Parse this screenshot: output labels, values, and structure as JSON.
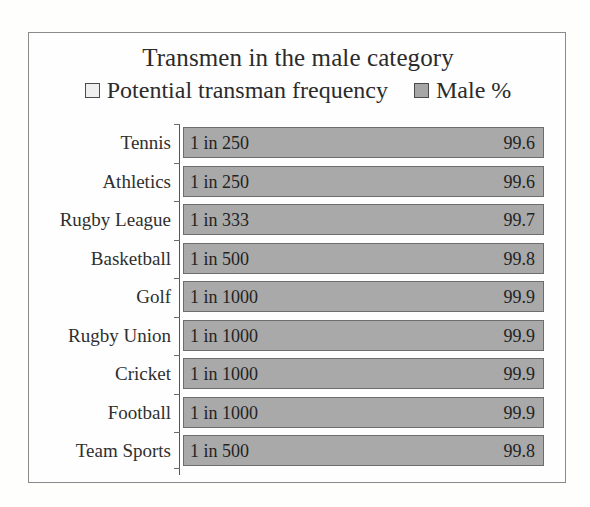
{
  "chart_data": {
    "type": "bar",
    "orientation": "horizontal",
    "title": "Transmen in the male category",
    "xlabel": "",
    "ylabel": "",
    "grid": false,
    "legend_position": "top-center",
    "legend": [
      {
        "label": "Potential transman frequency",
        "swatch": "light",
        "color": "#efefef"
      },
      {
        "label": "Male %",
        "swatch": "dark",
        "color": "#a6a6a6"
      }
    ],
    "categories": [
      "Tennis",
      "Athletics",
      "Rugby League",
      "Basketball",
      "Golf",
      "Rugby Union",
      "Cricket",
      "Football",
      "Team Sports"
    ],
    "series": [
      {
        "name": "Potential transman frequency",
        "values": [
          "1 in 250",
          "1 in 250",
          "1 in 333",
          "1 in 500",
          "1 in 1000",
          "1 in 1000",
          "1 in 1000",
          "1 in 1000",
          "1 in 500"
        ]
      },
      {
        "name": "Male %",
        "values": [
          99.6,
          99.6,
          99.7,
          99.8,
          99.9,
          99.9,
          99.9,
          99.9,
          99.8
        ]
      }
    ],
    "xlim": [
      0,
      100
    ]
  },
  "rows": [
    {
      "category": "Tennis",
      "frequency": "1 in 250",
      "male_percent": "99.6"
    },
    {
      "category": "Athletics",
      "frequency": "1 in 250",
      "male_percent": "99.6"
    },
    {
      "category": "Rugby League",
      "frequency": "1 in 333",
      "male_percent": "99.7"
    },
    {
      "category": "Basketball",
      "frequency": "1 in 500",
      "male_percent": "99.8"
    },
    {
      "category": "Golf",
      "frequency": "1 in 1000",
      "male_percent": "99.9"
    },
    {
      "category": "Rugby Union",
      "frequency": "1 in 1000",
      "male_percent": "99.9"
    },
    {
      "category": "Cricket",
      "frequency": "1 in 1000",
      "male_percent": "99.9"
    },
    {
      "category": "Football",
      "frequency": "1 in 1000",
      "male_percent": "99.9"
    },
    {
      "category": "Team Sports",
      "frequency": "1 in 500",
      "male_percent": "99.8"
    }
  ]
}
